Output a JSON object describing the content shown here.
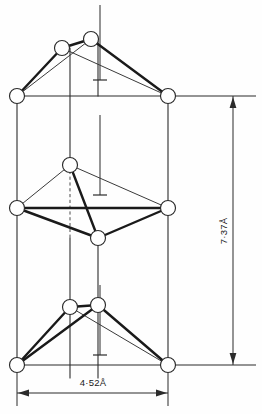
{
  "figure": {
    "background_color": "#fefefe",
    "line_color": "#2b2b2b",
    "atom_fill_color": "#ffffff"
  },
  "dimensions": {
    "height": {
      "label": "7·37Å",
      "value": 7.37,
      "unit": "Å",
      "orientation": "vertical",
      "axis": "c"
    },
    "width": {
      "label": "4·52Å",
      "value": 4.52,
      "unit": "Å",
      "orientation": "horizontal",
      "axis": "a"
    }
  },
  "structure": {
    "atom_radius": 7.5,
    "cell": {
      "left_x": 17,
      "right_x": 168,
      "top_y": 96,
      "bottom_y": 365,
      "mid_y": 208
    },
    "atoms": [
      {
        "id": "top-left-corner",
        "x": 17,
        "y": 96,
        "layer": "top",
        "role": "corner"
      },
      {
        "id": "top-right-corner",
        "x": 168,
        "y": 96,
        "layer": "top",
        "role": "corner"
      },
      {
        "id": "top-inner-left",
        "x": 62,
        "y": 48,
        "layer": "top",
        "role": "apex"
      },
      {
        "id": "top-inner-right",
        "x": 91,
        "y": 39,
        "layer": "top",
        "role": "apex"
      },
      {
        "id": "mid-left-corner",
        "x": 17,
        "y": 208,
        "layer": "middle",
        "role": "corner"
      },
      {
        "id": "mid-right-corner",
        "x": 168,
        "y": 208,
        "layer": "middle",
        "role": "corner"
      },
      {
        "id": "mid-upper-inner",
        "x": 70,
        "y": 165,
        "layer": "middle",
        "role": "apex"
      },
      {
        "id": "mid-lower-inner",
        "x": 98,
        "y": 238,
        "layer": "middle",
        "role": "apex"
      },
      {
        "id": "bot-left-corner",
        "x": 17,
        "y": 365,
        "layer": "bottom",
        "role": "corner"
      },
      {
        "id": "bot-right-corner",
        "x": 168,
        "y": 365,
        "layer": "bottom",
        "role": "corner"
      },
      {
        "id": "bot-inner-left",
        "x": 70,
        "y": 307,
        "layer": "bottom",
        "role": "apex"
      },
      {
        "id": "bot-inner-right",
        "x": 98,
        "y": 305,
        "layer": "bottom",
        "role": "apex"
      }
    ],
    "cell_edges": [
      {
        "x1": 17,
        "y1": 96,
        "x2": 168,
        "y2": 96
      },
      {
        "x1": 17,
        "y1": 208,
        "x2": 168,
        "y2": 208
      },
      {
        "x1": 17,
        "y1": 365,
        "x2": 168,
        "y2": 365
      },
      {
        "x1": 17,
        "y1": 96,
        "x2": 17,
        "y2": 365
      },
      {
        "x1": 168,
        "y1": 96,
        "x2": 168,
        "y2": 365
      }
    ],
    "bonds_thick": [
      {
        "x1": 62,
        "y1": 48,
        "x2": 91,
        "y2": 39
      },
      {
        "x1": 62,
        "y1": 48,
        "x2": 17,
        "y2": 96
      },
      {
        "x1": 91,
        "y1": 39,
        "x2": 168,
        "y2": 96
      },
      {
        "x1": 70,
        "y1": 165,
        "x2": 98,
        "y2": 238
      },
      {
        "x1": 17,
        "y1": 208,
        "x2": 98,
        "y2": 238
      },
      {
        "x1": 17,
        "y1": 208,
        "x2": 168,
        "y2": 208
      },
      {
        "x1": 98,
        "y1": 238,
        "x2": 168,
        "y2": 208
      },
      {
        "x1": 70,
        "y1": 307,
        "x2": 98,
        "y2": 305
      },
      {
        "x1": 70,
        "y1": 307,
        "x2": 17,
        "y2": 365
      },
      {
        "x1": 98,
        "y1": 305,
        "x2": 168,
        "y2": 365
      },
      {
        "x1": 98,
        "y1": 305,
        "x2": 17,
        "y2": 365
      }
    ],
    "bonds_thin": [
      {
        "x1": 62,
        "y1": 48,
        "x2": 168,
        "y2": 96
      },
      {
        "x1": 91,
        "y1": 39,
        "x2": 17,
        "y2": 96
      },
      {
        "x1": 70,
        "y1": 165,
        "x2": 17,
        "y2": 208
      },
      {
        "x1": 70,
        "y1": 165,
        "x2": 168,
        "y2": 208
      },
      {
        "x1": 70,
        "y1": 307,
        "x2": 168,
        "y2": 365
      }
    ],
    "bonds_dashed": [
      {
        "x1": 70,
        "y1": 165,
        "x2": 70,
        "y2": 238
      }
    ],
    "axes": [
      {
        "id": "axis-top",
        "x": 100,
        "y1": 5,
        "y2": 80,
        "tick_y": 80
      },
      {
        "id": "axis-middle",
        "x": 100,
        "y1": 115,
        "y2": 195,
        "tick_y": 195
      },
      {
        "id": "axis-bottom",
        "x": 100,
        "y1": 285,
        "y2": 355,
        "tick_y": 355
      }
    ],
    "internal_verticals": [
      {
        "x": 70,
        "y1": 48,
        "y2": 165
      },
      {
        "x": 70,
        "y1": 238,
        "y2": 307
      },
      {
        "x": 98,
        "y1": 39,
        "y2": 96
      },
      {
        "x": 98,
        "y1": 238,
        "y2": 305
      },
      {
        "x": 70,
        "y1": 307,
        "y2": 375
      },
      {
        "x": 98,
        "y1": 305,
        "y2": 375
      }
    ]
  },
  "annotations": {
    "vertical_dim": {
      "ext_top": {
        "x1": 176,
        "y": 96,
        "x2": 256
      },
      "ext_bottom": {
        "x1": 176,
        "y": 365,
        "x2": 256
      },
      "line_x": 233,
      "arrow_top_y": 96,
      "arrow_bottom_y": 365,
      "label_x": 227,
      "label_y": 231
    },
    "horizontal_dim": {
      "ext_left": {
        "x": 17,
        "y1": 373,
        "y2": 406
      },
      "ext_right": {
        "x": 168,
        "y1": 373,
        "y2": 406
      },
      "line_y": 393,
      "arrow_left_x": 17,
      "arrow_right_x": 168,
      "label_x": 93,
      "label_y": 384
    }
  }
}
